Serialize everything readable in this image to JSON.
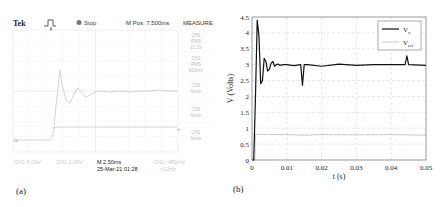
{
  "scope": {
    "label": "(a)",
    "brand": "Tek",
    "trigger_icon": "trigger-rising-edge-icon",
    "status_icon": "stop-dot-icon",
    "status": "Stop",
    "m_pos": "M Pos: 7.500ms",
    "measure_title": "MEASURE",
    "measure_items": [
      {
        "ch": "CH1",
        "type": "RMS",
        "value": "11.1V"
      },
      {
        "ch": "CH2",
        "type": "RMS",
        "value": "920mV"
      },
      {
        "ch": "CH1",
        "type": "None",
        "value": ""
      },
      {
        "ch": "CH1",
        "type": "None",
        "value": ""
      },
      {
        "ch": "CH1",
        "type": "None",
        "value": ""
      }
    ],
    "ch1_scale": "CH1 5.00V",
    "ch2_scale": "CH2 1.00V",
    "timebase": "M 2.50ms",
    "datetime": "25-Mar-21 01:28",
    "trigger_readout": "CH2 ∕ 480mV",
    "freq_readout": "<10Hz",
    "colors": {
      "trace": "#d8d8d8",
      "grid": "#e8e8e8",
      "text": "#222222",
      "faint": "#bbbbbb"
    }
  },
  "chart_data": {
    "type": "line",
    "label": "(b)",
    "title": "",
    "xlabel": "t (s)",
    "ylabel": "V (Volts)",
    "xlim": [
      0,
      0.05
    ],
    "ylim": [
      0,
      4.5
    ],
    "xticks": [
      "0",
      "0.01",
      "0.02",
      "0.03",
      "0.04",
      "0.05"
    ],
    "yticks": [
      "0",
      "0.5",
      "1",
      "1.5",
      "2",
      "2.5",
      "3",
      "3.5",
      "4",
      "4.5"
    ],
    "grid": true,
    "legend_position": "top-right",
    "series": [
      {
        "name": "Vo",
        "legend_main": "V",
        "legend_sub": "o",
        "color": "#111111",
        "x": [
          0,
          0.0005,
          0.001,
          0.0015,
          0.002,
          0.0025,
          0.003,
          0.0035,
          0.004,
          0.0045,
          0.005,
          0.0055,
          0.006,
          0.0065,
          0.007,
          0.0075,
          0.008,
          0.009,
          0.01,
          0.012,
          0.014,
          0.0145,
          0.015,
          0.016,
          0.02,
          0.025,
          0.03,
          0.035,
          0.04,
          0.044,
          0.0445,
          0.045,
          0.05
        ],
        "y": [
          0,
          0,
          2.0,
          4.4,
          3.9,
          2.4,
          2.5,
          3.2,
          3.1,
          2.8,
          2.85,
          3.05,
          3.1,
          2.95,
          3.0,
          3.02,
          2.98,
          3.0,
          3.0,
          2.97,
          3.0,
          2.35,
          3.0,
          3.0,
          2.95,
          3.02,
          2.98,
          3.0,
          3.0,
          3.0,
          3.28,
          3.0,
          2.98
        ]
      },
      {
        "name": "Vref",
        "legend_main": "V",
        "legend_sub": "ref",
        "color": "#bbbbbb",
        "x": [
          0,
          0.0008,
          0.001,
          0.002,
          0.01,
          0.015,
          0.02,
          0.03,
          0.04,
          0.05
        ],
        "y": [
          0,
          0,
          0.82,
          0.8,
          0.8,
          0.78,
          0.8,
          0.79,
          0.8,
          0.78
        ]
      }
    ]
  }
}
